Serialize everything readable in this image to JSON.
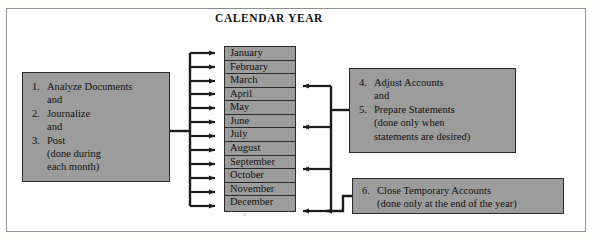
{
  "diagram": {
    "title": "CALENDAR YEAR",
    "colors": {
      "box_fill": "#9c9c9c",
      "box_border": "#2a2a2a",
      "frame_border": "#8e8e8e",
      "background": "#ffffff",
      "text": "#111111"
    }
  },
  "left_box": {
    "name": "monthly-activities-box",
    "items": [
      {
        "num": "1.",
        "text": "Analyze Documents",
        "sub": "and"
      },
      {
        "num": "2.",
        "text": "Journalize",
        "sub": "and"
      },
      {
        "num": "3.",
        "text": "Post",
        "sub": "(done during",
        "sub2": "each month)"
      }
    ]
  },
  "months": {
    "name": "calendar-year-months",
    "list": [
      "January",
      "February",
      "March",
      "April",
      "May",
      "June",
      "July",
      "August",
      "September",
      "October",
      "November",
      "December"
    ]
  },
  "adjust_box": {
    "name": "adjust-prepare-box",
    "items": [
      {
        "num": "4.",
        "text": "Adjust Accounts",
        "sub": "and"
      },
      {
        "num": "5.",
        "text": "Prepare Statements",
        "sub": "(done only when",
        "sub2": "statements are desired)"
      }
    ]
  },
  "close_box": {
    "name": "close-temporary-accounts-box",
    "items": [
      {
        "num": "6.",
        "text": "Close Temporary Accounts",
        "sub": "(done only at the end of the year)"
      }
    ]
  }
}
